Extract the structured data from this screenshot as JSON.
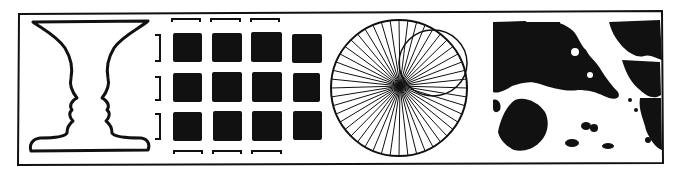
{
  "figure": {
    "description": "Strip of four ambiguous / perceptual illusion drawings inside a hand-drawn frame",
    "ink_color": "#111111",
    "background": "#ffffff",
    "panels": [
      {
        "id": "rubin-vase",
        "label": "Rubin vase / two faces profile"
      },
      {
        "id": "grouping-grid",
        "label": "Grid of black squares with brackets (grouping)"
      },
      {
        "id": "radial-circle",
        "label": "Circle with radial spokes and inner circle"
      },
      {
        "id": "hidden-figure",
        "label": "Black-and-white blotch ambiguous image"
      }
    ],
    "grid": {
      "rows": 3,
      "cols": 4,
      "top_brackets": 3,
      "bottom_brackets": 3,
      "side_brackets": 3
    },
    "radial": {
      "spokes": 48
    }
  }
}
